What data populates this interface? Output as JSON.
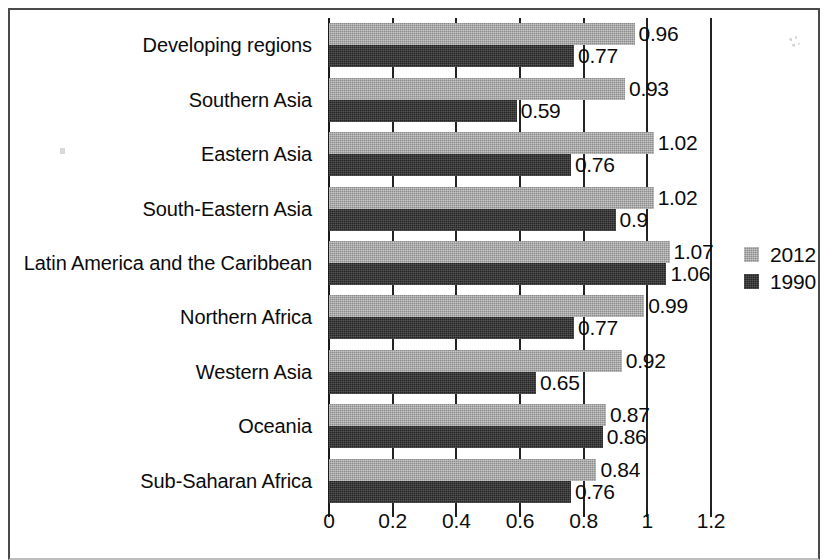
{
  "chart_data": {
    "type": "bar",
    "orientation": "horizontal",
    "title": "",
    "subtitle": "",
    "xlabel": "",
    "ylabel": "",
    "xlim": [
      0,
      1.2
    ],
    "xticks": [
      "0",
      "0.2",
      "0.4",
      "0.6",
      "0.8",
      "1",
      "1.2"
    ],
    "xtick_values": [
      0,
      0.2,
      0.4,
      0.6,
      0.8,
      1,
      1.2
    ],
    "grid": true,
    "grid_axis": "x",
    "legend_position": "right",
    "categories": [
      "Developing regions",
      "Southern Asia",
      "Eastern Asia",
      "South-Eastern Asia",
      "Latin America and the Caribbean",
      "Northern Africa",
      "Western Asia",
      "Oceania",
      "Sub-Saharan Africa"
    ],
    "series": [
      {
        "name": "2012",
        "color": "#8c8c8c",
        "values": [
          0.96,
          0.93,
          1.02,
          1.02,
          1.07,
          0.99,
          0.92,
          0.87,
          0.84
        ],
        "labels": [
          "0.96",
          "0.93",
          "1.02",
          "1.02",
          "1.07",
          "0.99",
          "0.92",
          "0.87",
          "0.84"
        ]
      },
      {
        "name": "1990",
        "color": "#242424",
        "values": [
          0.77,
          0.59,
          0.76,
          0.9,
          1.06,
          0.77,
          0.65,
          0.86,
          0.76
        ],
        "labels": [
          "0.77",
          "0.59",
          "0.76",
          "0.9",
          "1.06",
          "0.77",
          "0.65",
          "0.86",
          "0.76"
        ]
      }
    ]
  },
  "legend": {
    "entries": [
      {
        "label": "2012",
        "swatch": "s2012"
      },
      {
        "label": "1990",
        "swatch": "s1990"
      }
    ]
  }
}
